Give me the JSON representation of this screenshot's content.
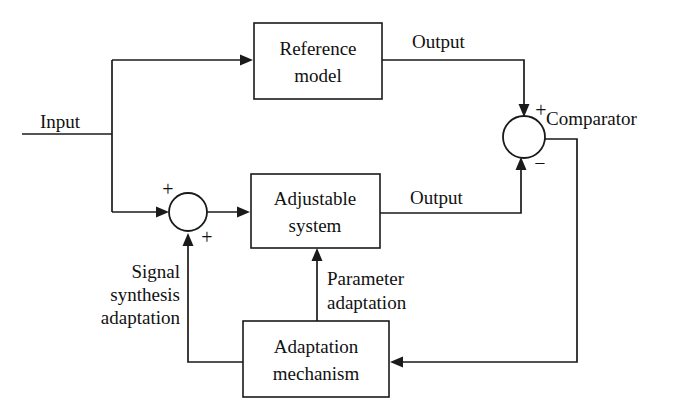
{
  "diagram": {
    "blocks": [
      {
        "id": "reference-model",
        "line1": "Reference",
        "line2": "model"
      },
      {
        "id": "adjustable-system",
        "line1": "Adjustable",
        "line2": "system"
      },
      {
        "id": "adaptation-mechanism",
        "line1": "Adaptation",
        "line2": "mechanism"
      }
    ],
    "junctions": [
      {
        "id": "comparator",
        "label": "Comparator",
        "sign_top": "+",
        "sign_bottom": "−"
      },
      {
        "id": "summing-junction",
        "sign_top": "+",
        "sign_bottom": "+"
      }
    ],
    "signals": {
      "input": "Input",
      "reference_output": "Output",
      "plant_output": "Output",
      "signal_synthesis": {
        "line1": "Signal",
        "line2": "synthesis",
        "line3": "adaptation"
      },
      "parameter_adaptation": {
        "line1": "Parameter",
        "line2": "adaptation"
      }
    },
    "colors": {
      "line": "#1a1a1a",
      "text": "#111111",
      "background": "#ffffff"
    }
  }
}
